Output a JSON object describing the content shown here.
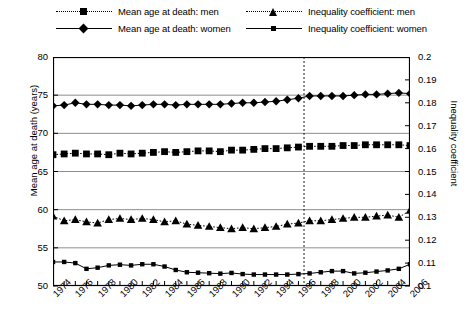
{
  "legend": {
    "items": [
      {
        "label": "Mean age at death: men",
        "marker": "square",
        "style": "dotted",
        "key": "men-mean-age"
      },
      {
        "label": "Inequality coefficient: men",
        "marker": "triangle",
        "style": "dotted",
        "key": "men-inequality"
      },
      {
        "label": "Mean age at death: women",
        "marker": "diamond",
        "style": "solid",
        "key": "women-mean-age"
      },
      {
        "label": "Inequality coefficient: women",
        "marker": "small-square",
        "style": "solid",
        "key": "women-inequality"
      }
    ]
  },
  "chart_data": {
    "type": "line",
    "title": "",
    "xlabel": "",
    "ylabel": "Mean age at death (years)",
    "y2label": "Inequality coefficient",
    "ylim": [
      50,
      80
    ],
    "y2lim": [
      0.1,
      0.2
    ],
    "xlim": [
      1974,
      2006
    ],
    "yticks": [
      50,
      55,
      60,
      65,
      70,
      75,
      80
    ],
    "y2ticks": [
      "0.1",
      "0.11",
      "0.12",
      "0.13",
      "0.14",
      "0.15",
      "0.16",
      "0.17",
      "0.18",
      "0.19",
      "0.2"
    ],
    "grid": "horizontal",
    "legend_position": "top",
    "annotations": [
      {
        "type": "vline",
        "x": 1996.5,
        "style": "dashed"
      }
    ],
    "x": [
      1974,
      1975,
      1976,
      1977,
      1978,
      1979,
      1980,
      1981,
      1982,
      1983,
      1984,
      1985,
      1986,
      1987,
      1988,
      1989,
      1990,
      1991,
      1992,
      1993,
      1994,
      1995,
      1996,
      1997,
      1998,
      1999,
      2000,
      2001,
      2002,
      2003,
      2004,
      2005,
      2006
    ],
    "xtick_labels": [
      "1974",
      "1976",
      "1978",
      "1980",
      "1982",
      "1984",
      "1986",
      "1988",
      "1990",
      "1992",
      "1994",
      "1996",
      "1998",
      "2000",
      "2002",
      "2004",
      "2006"
    ],
    "series": [
      {
        "name": "Mean age at death: men",
        "axis": "left",
        "marker": "square",
        "style": "dotted",
        "values": [
          67.2,
          67.3,
          67.4,
          67.3,
          67.3,
          67.2,
          67.4,
          67.3,
          67.4,
          67.5,
          67.6,
          67.5,
          67.6,
          67.7,
          67.7,
          67.6,
          67.8,
          67.8,
          67.9,
          68.0,
          68.0,
          68.1,
          68.2,
          68.3,
          68.3,
          68.3,
          68.4,
          68.4,
          68.5,
          68.5,
          68.5,
          68.5,
          68.4
        ]
      },
      {
        "name": "Mean age at death: women",
        "axis": "left",
        "marker": "diamond",
        "style": "solid",
        "values": [
          73.6,
          73.7,
          74.0,
          73.8,
          73.8,
          73.7,
          73.7,
          73.6,
          73.7,
          73.8,
          73.8,
          73.7,
          73.8,
          73.8,
          73.8,
          73.8,
          73.9,
          74.0,
          74.0,
          74.1,
          74.2,
          74.4,
          74.6,
          74.9,
          74.9,
          74.9,
          74.9,
          75.0,
          75.1,
          75.1,
          75.2,
          75.3,
          75.2
        ]
      },
      {
        "name": "Inequality coefficient: men",
        "axis": "right",
        "marker": "triangle",
        "style": "dotted",
        "values": [
          0.1305,
          0.1285,
          0.129,
          0.128,
          0.1275,
          0.129,
          0.1295,
          0.129,
          0.1295,
          0.129,
          0.128,
          0.1285,
          0.127,
          0.1265,
          0.126,
          0.1255,
          0.125,
          0.1255,
          0.125,
          0.1255,
          0.126,
          0.127,
          0.1275,
          0.1285,
          0.1285,
          0.129,
          0.1295,
          0.13,
          0.13,
          0.1305,
          0.131,
          0.13,
          0.133
        ]
      },
      {
        "name": "Inequality coefficient: women",
        "axis": "right",
        "marker": "small-square",
        "style": "solid",
        "values": [
          0.1105,
          0.1105,
          0.11,
          0.1075,
          0.108,
          0.109,
          0.1093,
          0.109,
          0.1095,
          0.1095,
          0.1085,
          0.107,
          0.106,
          0.1058,
          0.1056,
          0.1054,
          0.1057,
          0.1052,
          0.105,
          0.105,
          0.105,
          0.105,
          0.1052,
          0.1055,
          0.106,
          0.1065,
          0.1065,
          0.1055,
          0.1058,
          0.1063,
          0.1068,
          0.1075,
          0.1095
        ]
      }
    ]
  }
}
